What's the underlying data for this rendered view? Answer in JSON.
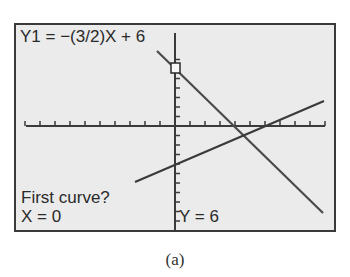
{
  "screen": {
    "equation_label": "Y1 = −(3/2)X + 6",
    "prompt": "First curve?",
    "cursor_x": "X = 0",
    "cursor_y": "Y = 6"
  },
  "caption": "(a)",
  "colors": {
    "screen_bg": "#ebebeb",
    "ink": "#3a3a3a",
    "border": "#3a3a3a"
  },
  "chart_data": {
    "type": "line",
    "title": "Y1 = −(3/2)X + 6",
    "xlim": [
      -10,
      10
    ],
    "ylim": [
      -10,
      10
    ],
    "xtick_step": 1,
    "ytick_step": 1,
    "series": [
      {
        "name": "Y1",
        "equation": "y = -(3/2)x + 6",
        "x": [
          -1.2,
          9.9
        ],
        "y": [
          7.8,
          -8.85
        ]
      },
      {
        "name": "Y2",
        "equation": "y = (2/3)x - 4",
        "x": [
          -2.7,
          9.9
        ],
        "y": [
          -5.8,
          2.6
        ]
      }
    ],
    "cursor": {
      "x": 0,
      "y": 6
    },
    "annotations": [
      "First curve?",
      "X = 0",
      "Y = 6"
    ]
  }
}
